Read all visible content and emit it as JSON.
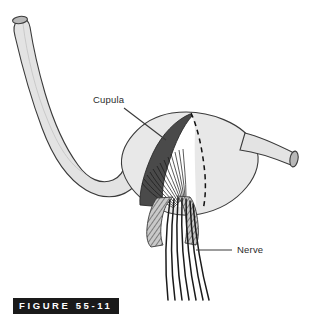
{
  "figure": {
    "caption": "FIGURE 55-11",
    "caption_banner_color": "#1a1a1a",
    "caption_text_color": "#ffffff",
    "background_color": "#ffffff"
  },
  "labels": {
    "cupula": "Cupula",
    "nerve": "Nerve"
  },
  "diagram": {
    "title_subject": "semicircular-canal-ampulla-crista-cupula",
    "stroke_color": "#3a3a3a",
    "canal_fill": "#e3e3e3",
    "ampulla_fill": "#e8e8e8",
    "cupula_fill": "#4a4a4a",
    "endolymph_fill": "#ffffff",
    "tube_cap_fill": "#b8b8b8",
    "crista_fill": "#b0b0b0",
    "nerve_fiber_color": "#1a1a1a",
    "leader_line_color": "#3a3a3a",
    "dashed_line_color": "#111111",
    "parts": [
      "semicircular-canal-tube",
      "tube-open-end-top-left",
      "tube-open-end-right",
      "ampulla-bulb",
      "cupula-gelatinous-mass",
      "hair-cell-stereocilia",
      "crista-ampullaris",
      "vestibular-nerve-fibers",
      "cut-edge-dashed-outline"
    ],
    "nerve_fiber_count": 7
  }
}
